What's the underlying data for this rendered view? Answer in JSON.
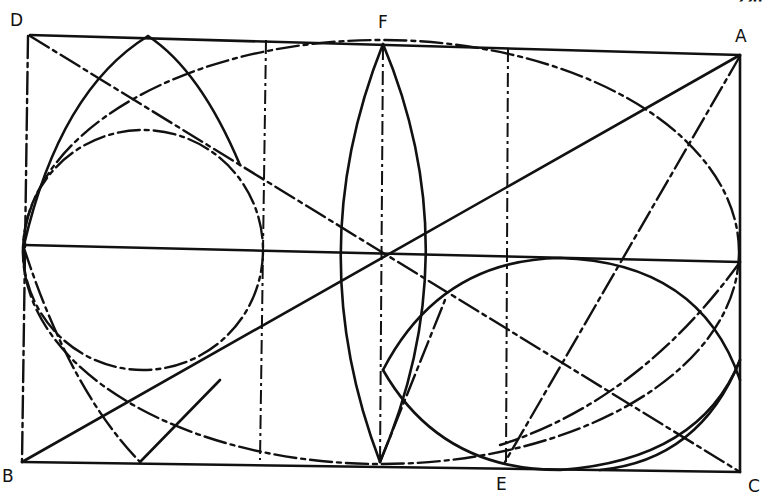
{
  "page_number": "220",
  "labels": {
    "D": "D",
    "F": "F",
    "A": "A",
    "B": "B",
    "E": "E",
    "C": "C"
  },
  "figure": {
    "points": {
      "D": [
        30,
        35
      ],
      "A": [
        740,
        55
      ],
      "B": [
        22,
        462
      ],
      "C": [
        740,
        472
      ],
      "F": [
        383,
        42
      ],
      "E": [
        505,
        464
      ]
    }
  }
}
